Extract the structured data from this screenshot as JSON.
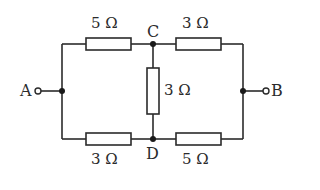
{
  "diagram": {
    "type": "circuit",
    "title": "",
    "nodes": {
      "A": {
        "label": "A"
      },
      "B": {
        "label": "B"
      },
      "C": {
        "label": "C"
      },
      "D": {
        "label": "D"
      }
    },
    "resistors": [
      {
        "id": "R_AC",
        "from": "A",
        "to": "C",
        "label": "5 Ω"
      },
      {
        "id": "R_CB",
        "from": "C",
        "to": "B",
        "label": "3 Ω"
      },
      {
        "id": "R_CD",
        "from": "C",
        "to": "D",
        "label": "3 Ω"
      },
      {
        "id": "R_AD",
        "from": "A",
        "to": "D",
        "label": "3 Ω"
      },
      {
        "id": "R_DB",
        "from": "D",
        "to": "B",
        "label": "5 Ω"
      }
    ],
    "colors": {
      "stroke": "#2b2b2b",
      "background": "#ffffff"
    }
  }
}
